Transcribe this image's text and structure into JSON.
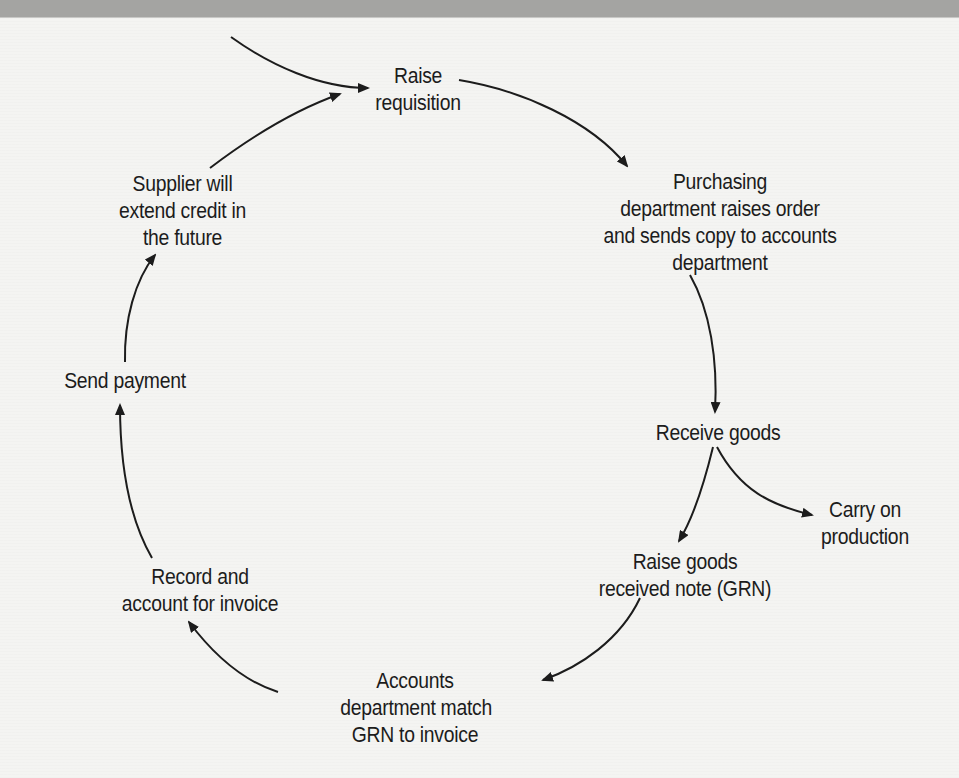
{
  "diagram": {
    "type": "cyclic-process-flow",
    "nodes": [
      {
        "id": "raise-requisition",
        "lines": [
          "Raise",
          "requisition"
        ]
      },
      {
        "id": "purchasing-raises-order",
        "lines": [
          "Purchasing",
          "department raises order",
          "and sends copy to accounts",
          "department"
        ]
      },
      {
        "id": "receive-goods",
        "lines": [
          "Receive goods"
        ]
      },
      {
        "id": "carry-on-production",
        "lines": [
          "Carry on",
          "production"
        ]
      },
      {
        "id": "raise-grn",
        "lines": [
          "Raise goods",
          "received note (GRN)"
        ]
      },
      {
        "id": "accounts-match-grn",
        "lines": [
          "Accounts",
          "department match",
          "GRN to invoice"
        ]
      },
      {
        "id": "record-invoice",
        "lines": [
          "Record and",
          "account for invoice"
        ]
      },
      {
        "id": "send-payment",
        "lines": [
          "Send payment"
        ]
      },
      {
        "id": "supplier-credit",
        "lines": [
          "Supplier will",
          "extend credit in",
          "the future"
        ]
      }
    ],
    "edges": [
      {
        "from": "external-entry",
        "to": "raise-requisition"
      },
      {
        "from": "raise-requisition",
        "to": "purchasing-raises-order"
      },
      {
        "from": "purchasing-raises-order",
        "to": "receive-goods"
      },
      {
        "from": "receive-goods",
        "to": "carry-on-production"
      },
      {
        "from": "receive-goods",
        "to": "raise-grn"
      },
      {
        "from": "raise-grn",
        "to": "accounts-match-grn"
      },
      {
        "from": "accounts-match-grn",
        "to": "record-invoice"
      },
      {
        "from": "record-invoice",
        "to": "send-payment"
      },
      {
        "from": "send-payment",
        "to": "supplier-credit"
      },
      {
        "from": "supplier-credit",
        "to": "raise-requisition"
      }
    ],
    "colors": {
      "ink": "#1c1c1c",
      "paper": "#f4f4f2",
      "top_bar": "#a4a4a2"
    }
  }
}
